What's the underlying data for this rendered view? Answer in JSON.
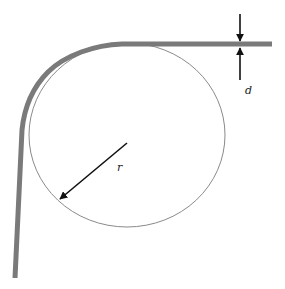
{
  "diagram": {
    "labels": {
      "thickness": "d",
      "radius": "r"
    },
    "colors": {
      "strip": "#7a7a7a",
      "circle": "#888888",
      "arrows": "#111111",
      "background": "#ffffff"
    },
    "elements": [
      {
        "id": "strip",
        "kind": "thick bent band",
        "meaning": "bent strip/sheet"
      },
      {
        "id": "circle",
        "kind": "thin outline",
        "meaning": "bending circle"
      },
      {
        "id": "radius-arrow",
        "kind": "arrow",
        "meaning": "radius r"
      },
      {
        "id": "thickness-arrows",
        "kind": "pair of opposing arrows",
        "meaning": "thickness d"
      }
    ]
  }
}
